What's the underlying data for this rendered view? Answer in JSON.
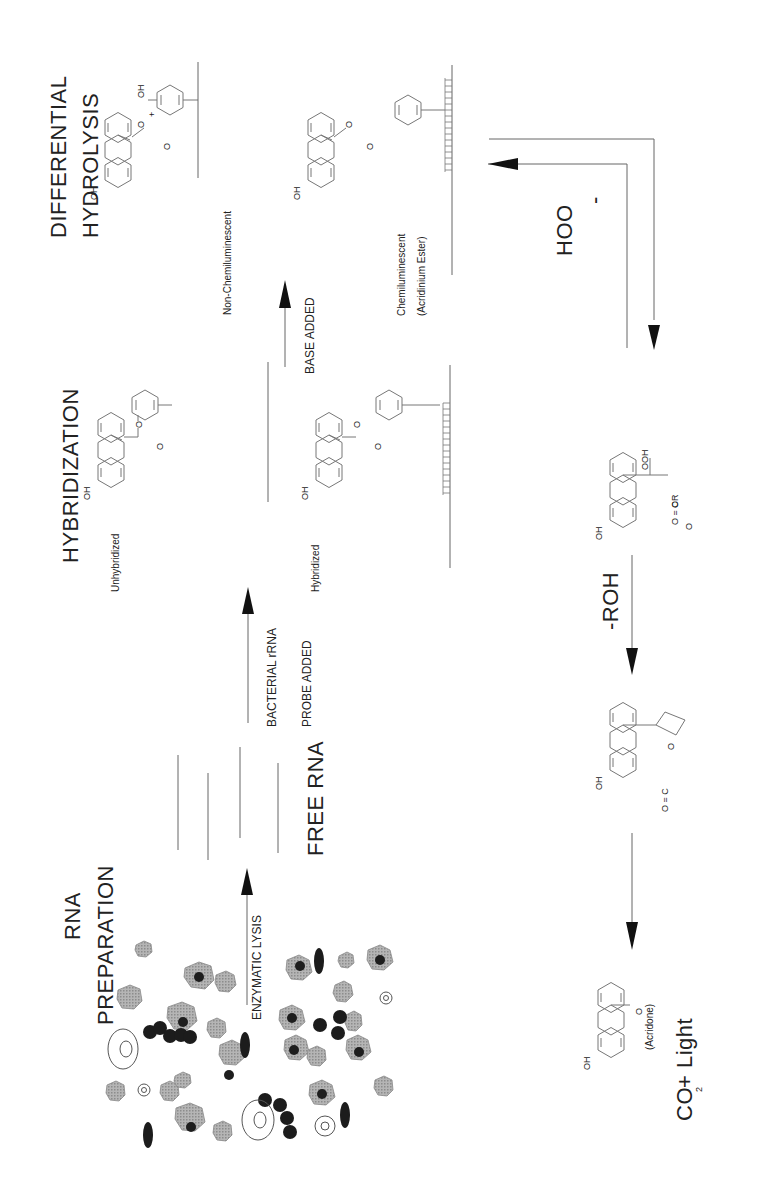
{
  "diagram": {
    "orientation": "rotated-90-ccw",
    "colors": {
      "background": "#ffffff",
      "ink": "#1a1a1a",
      "cells": "#9a9a9a",
      "nucleus": "#1e1e1e"
    },
    "stages": [
      {
        "id": "rna-prep",
        "title_line1": "RNA",
        "title_line2": "PREPARATION"
      },
      {
        "id": "hybridization",
        "title": "HYBRIDIZATION"
      },
      {
        "id": "differential-hydrolysis",
        "title_line1": "DIFFERENTIAL",
        "title_line2": "HYDROLYSIS"
      }
    ],
    "arrows": {
      "lysis": "ENZYMATIC LYSIS",
      "probe_line1": "BACTERIAL rRNA",
      "probe_line2": "PROBE ADDED",
      "base": "BASE ADDED",
      "peroxide": "HOO",
      "peroxide_charge": "-",
      "roh": "-ROH"
    },
    "labels": {
      "free_rna": "FREE RNA",
      "unhybridized": "Unhybridized",
      "hybridized": "Hybridized",
      "non_chemiluminescent": "Non-Chemiluminescent",
      "chemiluminescent": "Chemiluminescent",
      "acridinium_ester": "(Acridinium Ester)",
      "acridone": "(Acridone)",
      "products_co": "CO",
      "products_sub": "2",
      "products_rest": "+ Light"
    },
    "chem": {
      "oh3": "OH",
      "sub3": "3",
      "n_plus": "N+",
      "o": "O",
      "o_minus": "O",
      "minus": "-",
      "plus": "+",
      "oh": "OH",
      "ooh": "OOH",
      "or": "OR",
      "oc": "O = C"
    }
  }
}
